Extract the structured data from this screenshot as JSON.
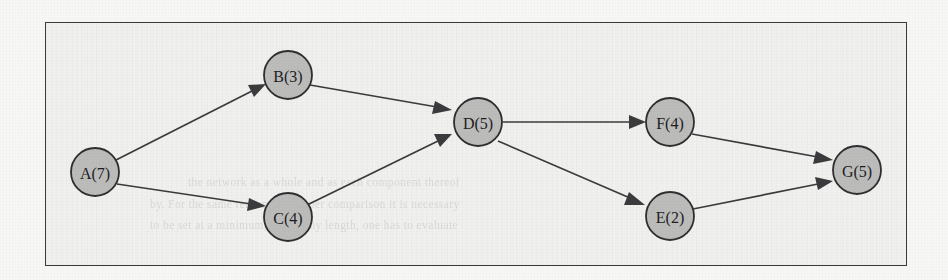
{
  "figure": {
    "kind": "activity-on-node-network-diagram",
    "border_color": "#3a3a3c",
    "page_background": "#f7f7f6",
    "panel_background": "#f1f1f0"
  },
  "graph": {
    "node_fill": "#bcbcbb",
    "node_stroke": "#2f2f31",
    "edge_color": "#3b3b3d",
    "node_radius": 24,
    "nodes": [
      {
        "id": "A",
        "label": "A(7)",
        "duration": 7,
        "cx": 95,
        "cy": 172
      },
      {
        "id": "B",
        "label": "B(3)",
        "duration": 3,
        "cx": 288,
        "cy": 75
      },
      {
        "id": "C",
        "label": "C(4)",
        "duration": 4,
        "cx": 288,
        "cy": 217
      },
      {
        "id": "D",
        "label": "D(5)",
        "duration": 5,
        "cx": 478,
        "cy": 122
      },
      {
        "id": "F",
        "label": "F(4)",
        "duration": 4,
        "cx": 670,
        "cy": 122
      },
      {
        "id": "E",
        "label": "E(2)",
        "duration": 2,
        "cx": 670,
        "cy": 216
      },
      {
        "id": "G",
        "label": "G(5)",
        "duration": 5,
        "cx": 857,
        "cy": 170
      }
    ],
    "edges": [
      {
        "from": "A",
        "to": "B"
      },
      {
        "from": "A",
        "to": "C"
      },
      {
        "from": "B",
        "to": "D"
      },
      {
        "from": "C",
        "to": "D"
      },
      {
        "from": "D",
        "to": "F"
      },
      {
        "from": "D",
        "to": "E"
      },
      {
        "from": "F",
        "to": "G"
      },
      {
        "from": "E",
        "to": "G"
      }
    ]
  },
  "ghost_text": {
    "note": "faint show-through text from the reverse side of the scanned page",
    "lines": [
      {
        "text": "the network as a whole and as each component thereof",
        "x": 188,
        "y": 183
      },
      {
        "text": "by. For the same reason, for proper comparison it is necessary",
        "x": 150,
        "y": 205
      },
      {
        "text": "to be set at a minimum, and at any length, one has to evaluate",
        "x": 150,
        "y": 226
      }
    ]
  }
}
